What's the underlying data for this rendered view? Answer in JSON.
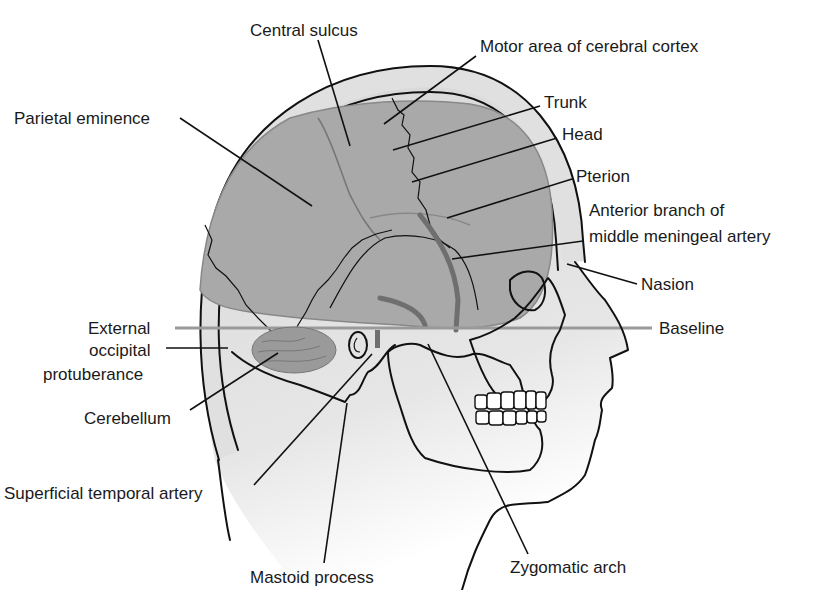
{
  "diagram": {
    "colors": {
      "brain": "#a9a9a9",
      "scalp": "#e0e0e0",
      "skin": "#dcdcdc",
      "artery": "#6f6f6f",
      "baseline": "#9a9a9a",
      "background": "#ffffff"
    },
    "labels": {
      "central_sulcus": "Central sulcus",
      "motor_area": "Motor area of cerebral cortex",
      "parietal_eminence": "Parietal eminence",
      "trunk": "Trunk",
      "head": "Head",
      "pterion": "Pterion",
      "anterior_branch_1": "Anterior branch of",
      "anterior_branch_2": "middle meningeal artery",
      "nasion": "Nasion",
      "baseline": "Baseline",
      "external_1": "External",
      "external_2": "occipital",
      "external_3": "protuberance",
      "cerebellum": "Cerebellum",
      "superficial_temporal": "Superficial temporal artery",
      "mastoid": "Mastoid process",
      "zygomatic": "Zygomatic arch"
    }
  }
}
